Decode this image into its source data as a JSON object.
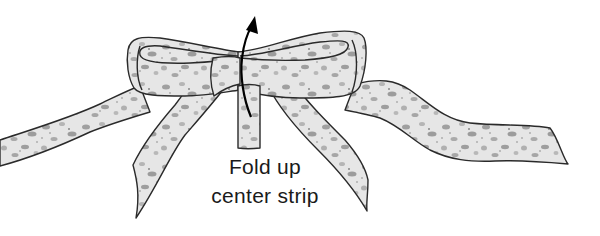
{
  "illustration": {
    "subject": "fabric bow with center strip",
    "caption_lines": [
      "Fold up",
      "center strip"
    ],
    "arrow": "curved arrow pointing up over the bow center",
    "colors": {
      "outline": "#2a2a2a",
      "fabric_light": "#e4e4e4",
      "fabric_dark": "#9a9a9a",
      "background": "#ffffff"
    }
  }
}
